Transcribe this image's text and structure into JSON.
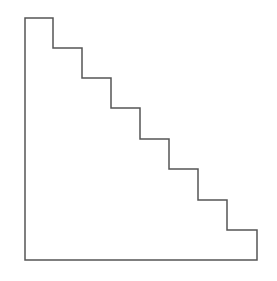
{
  "diagram": {
    "type": "staircase-polygon",
    "steps": 8,
    "stroke_color": "#555555",
    "fill_color": "none",
    "background": "#ffffff",
    "origin": {
      "x": 25,
      "y": 18
    },
    "bottom_y": 260,
    "right_x": 257,
    "step_x": [
      25,
      53,
      82,
      111,
      140,
      169,
      198,
      227,
      257
    ],
    "step_y": [
      18,
      48,
      78,
      108,
      139,
      169,
      200,
      230,
      260
    ]
  }
}
